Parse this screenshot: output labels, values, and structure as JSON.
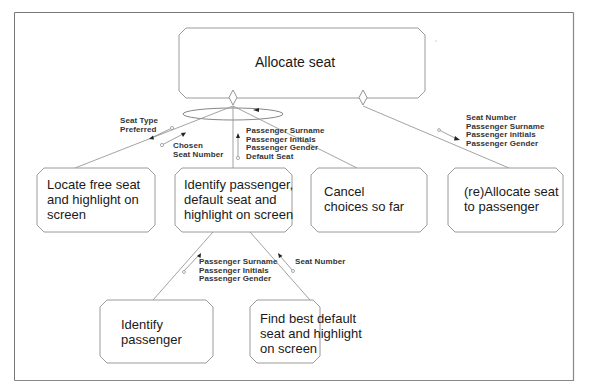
{
  "diagram": {
    "type": "structure-chart",
    "root": {
      "id": "allocate-seat",
      "label": "Allocate seat"
    },
    "children": [
      {
        "id": "locate-free-seat",
        "label": "Locate free seat and highlight on screen",
        "lines": [
          "Locate free seat",
          "and highlight on",
          "screen"
        ]
      },
      {
        "id": "identify-passenger-default-seat",
        "label": "Identify passenger, default seat and highlight on screen",
        "lines": [
          "Identify passenger,",
          "default seat and",
          "highlight on screen"
        ]
      },
      {
        "id": "cancel-choices",
        "label": "Cancel choices so far",
        "lines": [
          "Cancel",
          "choices so far"
        ]
      },
      {
        "id": "reallocate-seat",
        "label": "(re)Allocate seat to passenger",
        "lines": [
          "(re)Allocate seat",
          "to passenger"
        ]
      }
    ],
    "grandchildren": [
      {
        "id": "identify-passenger",
        "parent": "identify-passenger-default-seat",
        "label": "Identify passenger",
        "lines": [
          "Identify",
          "passenger"
        ]
      },
      {
        "id": "find-best-default-seat",
        "parent": "identify-passenger-default-seat",
        "label": "Find best default seat and highlight on screen",
        "lines": [
          "Find best default",
          "seat and highlight",
          "on screen"
        ]
      }
    ],
    "data_flows": [
      {
        "id": "flow-seat-type",
        "lines": [
          "Seat Type",
          "Preferred"
        ]
      },
      {
        "id": "flow-chosen-seat",
        "lines": [
          "Chosen",
          "Seat Number"
        ]
      },
      {
        "id": "flow-passenger-default",
        "lines": [
          "Passenger Surname",
          "Passenger Initials",
          "Passenger Gender",
          "Default Seat"
        ]
      },
      {
        "id": "flow-reallocate",
        "lines": [
          "Seat Number",
          "Passenger Surname",
          "Passenger initials",
          "Passenger Gender"
        ]
      },
      {
        "id": "flow-identify",
        "lines": [
          "Passenger Surname",
          "Passenger Initials",
          "Passenger Gender"
        ]
      },
      {
        "id": "flow-seat-number",
        "lines": [
          "Seat Number"
        ]
      }
    ],
    "annotations": {
      "iteration": "loop-ellipse",
      "selection": "diamond"
    }
  }
}
